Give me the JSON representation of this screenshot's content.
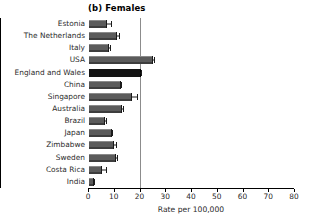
{
  "chart_data": {
    "type": "bar",
    "orientation": "horizontal",
    "title": "(b) Females",
    "xlabel": "Rate per 100,000",
    "ylabel": "",
    "xlim": [
      0,
      80
    ],
    "xticks": [
      0,
      10,
      20,
      30,
      40,
      50,
      60,
      70,
      80
    ],
    "grid": false,
    "legend": null,
    "reference_line": 20,
    "highlight_category": "England and Wales",
    "categories": [
      "Estonia",
      "The Netherlands",
      "Italy",
      "USA",
      "England and Wales",
      "China",
      "Singapore",
      "Australia",
      "Brazil",
      "Japan",
      "Zimbabwe",
      "Sweden",
      "Costa Rica",
      "India"
    ],
    "values": [
      7.0,
      11.0,
      7.8,
      24.8,
      20.0,
      12.5,
      16.8,
      13.0,
      6.3,
      9.0,
      9.8,
      10.5,
      5.2,
      2.0
    ],
    "error_high": [
      8.8,
      11.9,
      8.6,
      25.6,
      20.4,
      13.0,
      19.2,
      13.6,
      6.8,
      9.4,
      10.8,
      11.2,
      7.0,
      2.4
    ]
  },
  "colors": {
    "bar_fill": "#5b5b5b",
    "bar_highlight": "#141414",
    "axis": "#000000",
    "reference_line": "#8c8c8c",
    "text": "#2b2b2b",
    "background": "#ffffff"
  }
}
